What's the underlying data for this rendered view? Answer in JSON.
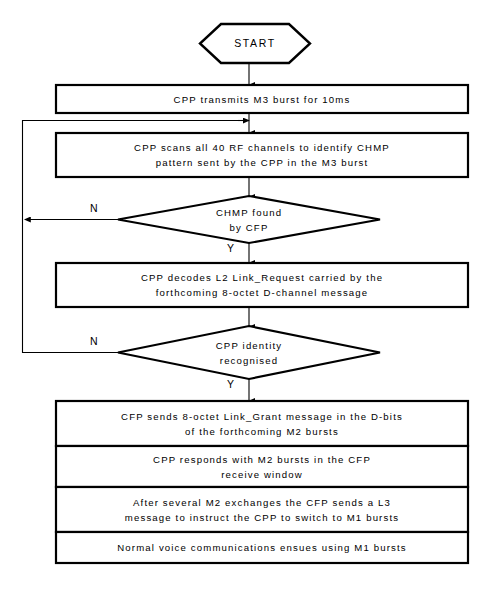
{
  "diagram": {
    "type": "flowchart",
    "title_text": "START",
    "orientation": "top-to-bottom",
    "colors": {
      "stroke": "#000000",
      "fill": "#ffffff",
      "text": "#000000"
    },
    "terminator": {
      "shape": "hexagon",
      "label": "START"
    },
    "process_boxes": [
      {
        "id": "p1",
        "lines": [
          "CPP transmits M3 burst for 10ms"
        ]
      },
      {
        "id": "p2",
        "lines": [
          "CPP scans all 40 RF channels to identify CHMP",
          "pattern sent by the CPP in the M3 burst"
        ]
      },
      {
        "id": "p3",
        "lines": [
          "CPP decodes L2 Link_Request carried by the",
          "forthcoming 8-octet D-channel message"
        ]
      }
    ],
    "decisions": [
      {
        "id": "d1",
        "lines": [
          "CHMP found",
          "by CFP"
        ],
        "no_label": "N",
        "yes_label": "Y",
        "no_direction": "left",
        "yes_direction": "down"
      },
      {
        "id": "d2",
        "lines": [
          "CPP identity",
          "recognised"
        ],
        "no_label": "N",
        "yes_label": "Y",
        "no_direction": "left",
        "yes_direction": "down"
      }
    ],
    "final_stack": [
      {
        "id": "f1",
        "lines": [
          "CFP sends 8-octet Link_Grant message in the D-bits",
          "of the forthcoming M2 bursts"
        ]
      },
      {
        "id": "f2",
        "lines": [
          "CPP responds with M2 bursts in the CFP",
          "receive window"
        ]
      },
      {
        "id": "f3",
        "lines": [
          "After several M2 exchanges the CFP sends a L3",
          "message to instruct the CPP to switch to M1 bursts"
        ]
      },
      {
        "id": "f4",
        "lines": [
          "Normal voice communications ensues using M1 bursts"
        ]
      }
    ],
    "loops": [
      {
        "id": "loop-no-1",
        "from": "d1",
        "to": "p2",
        "label": "N"
      },
      {
        "id": "loop-no-2",
        "from": "d2",
        "to": "p2",
        "label": "N"
      }
    ]
  }
}
